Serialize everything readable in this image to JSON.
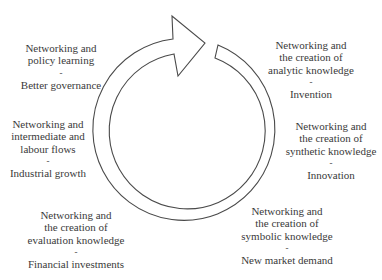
{
  "diagram": {
    "type": "cycle",
    "direction": "clockwise",
    "colors": {
      "stroke": "#4a4a4a",
      "text": "#3a3a3a",
      "background": "#ffffff"
    },
    "stages": [
      {
        "id": "analytic",
        "lines": [
          "Networking and",
          "the creation of",
          "analytic knowledge"
        ],
        "separator": "-",
        "outcome": "Invention"
      },
      {
        "id": "synthetic",
        "lines": [
          "Networking and",
          "the creation of",
          "synthetic knowledge"
        ],
        "separator": "-",
        "outcome": "Innovation"
      },
      {
        "id": "symbolic",
        "lines": [
          "Networking and",
          "the creation of",
          "symbolic knowledge"
        ],
        "separator": "-",
        "outcome": "New market demand"
      },
      {
        "id": "evaluation",
        "lines": [
          "Networking and",
          "the creation of",
          "evaluation knowledge"
        ],
        "separator": "-",
        "outcome": "Financial investments"
      },
      {
        "id": "labour",
        "lines": [
          "Networking and",
          "intermediate and",
          "labour flows"
        ],
        "separator": "-",
        "outcome": "Industrial growth"
      },
      {
        "id": "policy",
        "lines": [
          "Networking and",
          "policy learning"
        ],
        "separator": "-",
        "outcome": "Better governance"
      }
    ]
  }
}
